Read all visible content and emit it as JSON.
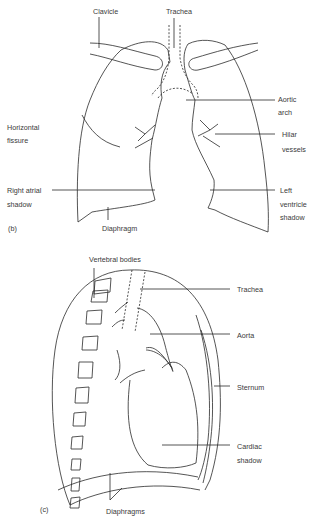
{
  "figure_b": {
    "panel_label": "(b)",
    "view": "frontal chest",
    "labels": {
      "clavicle": "Clavicle",
      "trachea": "Trachea",
      "aortic_arch_1": "Aortic",
      "aortic_arch_2": "arch",
      "horizontal_fissure_1": "Horizontal",
      "horizontal_fissure_2": "fissure",
      "hilar_vessels_1": "Hilar",
      "hilar_vessels_2": "vessels",
      "right_atrial_1": "Right atrial",
      "right_atrial_2": "shadow",
      "left_ventricle_1": "Left",
      "left_ventricle_2": "ventricle",
      "left_ventricle_3": "shadow",
      "diaphragm": "Diaphragm"
    }
  },
  "figure_c": {
    "panel_label": "(c)",
    "view": "lateral chest",
    "labels": {
      "vertebral_bodies": "Vertebral bodies",
      "trachea": "Trachea",
      "aorta": "Aorta",
      "sternum": "Sternum",
      "cardiac_shadow_1": "Cardiac",
      "cardiac_shadow_2": "shadow",
      "diaphragms": "Diaphragms"
    }
  },
  "colors": {
    "line": "#2a2a2a",
    "text": "#3a3a3a",
    "background": "#ffffff"
  }
}
